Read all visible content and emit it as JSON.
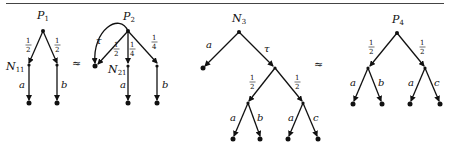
{
  "figure": {
    "relations": [
      "≈",
      "≈"
    ],
    "trees": [
      {
        "id": "P1",
        "root_label": "P1",
        "edges": [
          {
            "from": "P1",
            "to": "N11",
            "label": "1/2"
          },
          {
            "from": "P1",
            "to": "R1",
            "label": "1/2"
          },
          {
            "from": "N11",
            "to": "leaf",
            "label": "a"
          },
          {
            "from": "R1",
            "to": "leaf",
            "label": "b"
          }
        ],
        "inner_labels": [
          "N11"
        ]
      },
      {
        "id": "P2",
        "root_label": "P2",
        "edges": [
          {
            "from": "P2",
            "to": "loop-leaf",
            "label": "τ",
            "curved": true
          },
          {
            "from": "P2",
            "to": "loop-leaf",
            "label": "1/2"
          },
          {
            "from": "P2",
            "to": "N21",
            "label": "1/4"
          },
          {
            "from": "P2",
            "to": "R2",
            "label": "1/4"
          },
          {
            "from": "N21",
            "to": "leaf",
            "label": "a"
          },
          {
            "from": "R2",
            "to": "leaf",
            "label": "b"
          }
        ],
        "inner_labels": [
          "N21"
        ]
      },
      {
        "id": "N3",
        "root_label": "N3",
        "edges": [
          {
            "from": "N3",
            "to": "leaf",
            "label": "a"
          },
          {
            "from": "N3",
            "to": "M",
            "label": "τ"
          },
          {
            "from": "M",
            "to": "L",
            "label": "1/2"
          },
          {
            "from": "M",
            "to": "R",
            "label": "1/2"
          },
          {
            "from": "L",
            "to": "leaf",
            "label": "a"
          },
          {
            "from": "L",
            "to": "leaf",
            "label": "b"
          },
          {
            "from": "R",
            "to": "leaf",
            "label": "a"
          },
          {
            "from": "R",
            "to": "leaf",
            "label": "c"
          }
        ]
      },
      {
        "id": "P4",
        "root_label": "P4",
        "edges": [
          {
            "from": "P4",
            "to": "L",
            "label": "1/2"
          },
          {
            "from": "P4",
            "to": "R",
            "label": "1/2"
          },
          {
            "from": "L",
            "to": "leaf",
            "label": "a"
          },
          {
            "from": "L",
            "to": "leaf",
            "label": "b"
          },
          {
            "from": "R",
            "to": "leaf",
            "label": "a"
          },
          {
            "from": "R",
            "to": "leaf",
            "label": "c"
          }
        ]
      }
    ],
    "labels": {
      "P1": "P",
      "P1_sub": "1",
      "N11": "N",
      "N11_sub": "11",
      "P2": "P",
      "P2_sub": "2",
      "N21": "N",
      "N21_sub": "21",
      "N3": "N",
      "N3_sub": "3",
      "P4": "P",
      "P4_sub": "4",
      "a": "a",
      "b": "b",
      "c": "c",
      "tau": "τ",
      "half_num": "1",
      "half_den": "2",
      "quarter_num": "1",
      "quarter_den": "4",
      "approx": "≈"
    }
  }
}
